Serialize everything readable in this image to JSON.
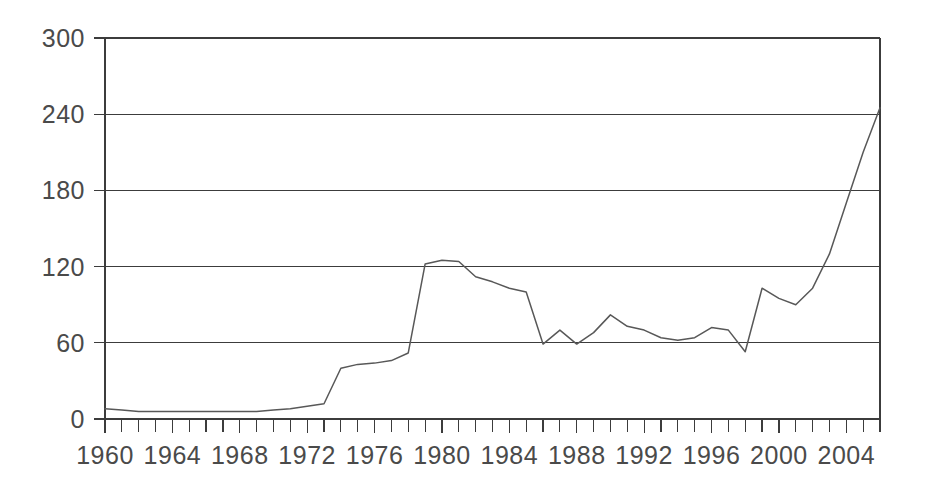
{
  "chart_data": {
    "type": "line",
    "title": "",
    "subtitle": "",
    "xlabel": "",
    "ylabel": "",
    "xlim": [
      1960,
      2006
    ],
    "ylim": [
      0,
      300
    ],
    "grid": true,
    "legend": "none",
    "y_ticks": [
      0,
      60,
      120,
      180,
      240,
      300
    ],
    "y_tick_labels": [
      "0",
      "60",
      "120",
      "180",
      "240",
      "300"
    ],
    "x_tick_labels": [
      "1960",
      "1964",
      "1968",
      "1972",
      "1976",
      "1980",
      "1984",
      "1988",
      "1992",
      "1996",
      "2000",
      "2004"
    ],
    "x_tick_label_years": [
      1960,
      1964,
      1968,
      1972,
      1976,
      1980,
      1984,
      1988,
      1992,
      1996,
      2000,
      2004
    ],
    "x_minor_tick_interval": 1,
    "line_color": "#585858",
    "grid_color": "#3c3c3c",
    "text_color": "#4a4a4a",
    "background_color": "#ffffff",
    "x": [
      1960,
      1961,
      1962,
      1963,
      1964,
      1965,
      1966,
      1967,
      1968,
      1969,
      1970,
      1971,
      1972,
      1973,
      1974,
      1975,
      1976,
      1977,
      1978,
      1979,
      1980,
      1981,
      1982,
      1983,
      1984,
      1985,
      1986,
      1987,
      1988,
      1989,
      1990,
      1991,
      1992,
      1993,
      1994,
      1995,
      1996,
      1997,
      1998,
      1999,
      2000,
      2001,
      2002,
      2003,
      2004,
      2005,
      2006
    ],
    "series": [
      {
        "name": "Price",
        "values": [
          8,
          7,
          6,
          6,
          6,
          6,
          6,
          6,
          6,
          6,
          7,
          8,
          10,
          12,
          40,
          43,
          44,
          46,
          52,
          122,
          125,
          124,
          112,
          108,
          103,
          100,
          59,
          70,
          59,
          68,
          82,
          73,
          70,
          64,
          62,
          64,
          72,
          70,
          53,
          103,
          95,
          90,
          103,
          130,
          170,
          210,
          245
        ]
      }
    ]
  }
}
